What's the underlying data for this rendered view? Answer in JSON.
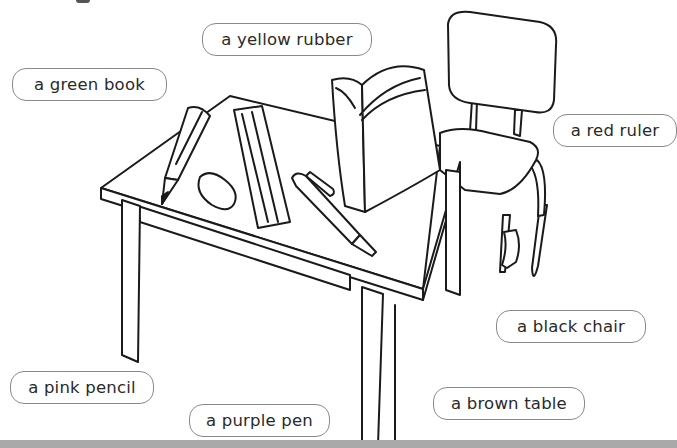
{
  "labels": [
    {
      "id": "yellow-rubber",
      "text": "a yellow rubber"
    },
    {
      "id": "green-book",
      "text": "a green book"
    },
    {
      "id": "red-ruler",
      "text": "a red ruler"
    },
    {
      "id": "black-chair",
      "text": "a black chair"
    },
    {
      "id": "pink-pencil",
      "text": "a pink pencil"
    },
    {
      "id": "purple-pen",
      "text": "a purple pen"
    },
    {
      "id": "brown-table",
      "text": "a brown table"
    }
  ],
  "illustration": {
    "objects": [
      "table",
      "chair",
      "book",
      "ruler",
      "rubber",
      "pencil",
      "pen"
    ],
    "line_color": "#1a1a1a"
  }
}
